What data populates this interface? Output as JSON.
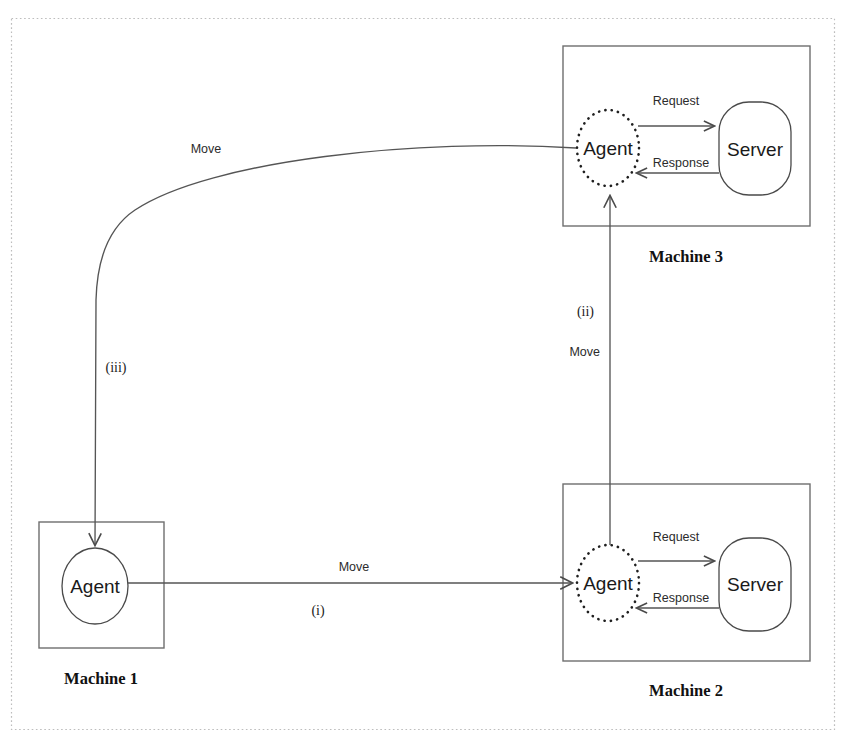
{
  "figure": {
    "background_color": "#ffffff",
    "border_color": "#bdbdbd"
  },
  "machines": [
    {
      "id": "machine-1",
      "caption": "Machine 1",
      "agent_label": "Agent",
      "agent_style": "solid",
      "has_server": false
    },
    {
      "id": "machine-2",
      "caption": "Machine 2",
      "agent_label": "Agent",
      "agent_style": "dotted",
      "has_server": true,
      "server_label": "Server",
      "request_label": "Request",
      "response_label": "Response"
    },
    {
      "id": "machine-3",
      "caption": "Machine 3",
      "agent_label": "Agent",
      "agent_style": "dotted",
      "has_server": true,
      "server_label": "Server",
      "request_label": "Request",
      "response_label": "Response"
    }
  ],
  "migrations": [
    {
      "id": "step-1",
      "step": "(i)",
      "action": "Move",
      "from": "Machine 1",
      "to": "Machine 2"
    },
    {
      "id": "step-2",
      "step": "(ii)",
      "action": "Move",
      "from": "Machine 2",
      "to": "Machine 3"
    },
    {
      "id": "step-3",
      "step": "(iii)",
      "action": "Move",
      "from": "Machine 3",
      "to": "Machine 1"
    }
  ]
}
